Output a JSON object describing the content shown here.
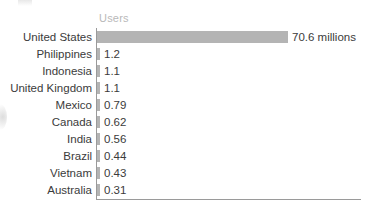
{
  "chart_data": {
    "type": "bar",
    "orientation": "horizontal",
    "title": "",
    "subtitle": "",
    "xlabel": "",
    "ylabel": "",
    "value_column_header": "Users",
    "unit_note": "millions",
    "grid": false,
    "legend": "none",
    "xlim": [
      0,
      70.6
    ],
    "categories": [
      "United States",
      "Philippines",
      "Indonesia",
      "United Kingdom",
      "Mexico",
      "Canada",
      "India",
      "Brazil",
      "Vietnam",
      "Australia"
    ],
    "values": [
      70.6,
      1.2,
      1.1,
      1.1,
      0.79,
      0.62,
      0.56,
      0.44,
      0.43,
      0.31
    ],
    "value_labels": [
      "70.6 millions",
      "1.2",
      "1.1",
      "1.1",
      "0.79",
      "0.62",
      "0.56",
      "0.44",
      "0.43",
      "0.31"
    ],
    "bar_color": "#b4b4b4",
    "axis_color": "#9a9a9a",
    "label_color": "#3b3b3b",
    "header_color": "#b9b9b9"
  }
}
